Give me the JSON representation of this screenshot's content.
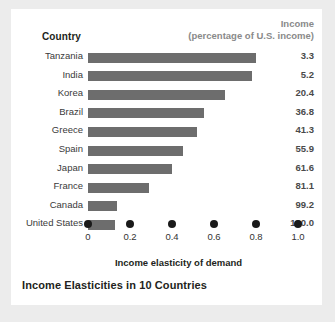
{
  "chart_data": {
    "type": "bar",
    "orientation": "horizontal",
    "title": "Income Elasticities in 10 Countries",
    "xlabel": "Income elasticity of demand",
    "ylabel": "",
    "xlim": [
      0,
      1.0
    ],
    "xticks": [
      "0",
      "0.2",
      "0.4",
      "0.6",
      "0.8",
      "1.0"
    ],
    "xtick_values": [
      0,
      0.2,
      0.4,
      0.6,
      0.8,
      1.0
    ],
    "grid": false,
    "legend": "none",
    "categories": [
      "Tanzania",
      "India",
      "Korea",
      "Brazil",
      "Greece",
      "Spain",
      "Japan",
      "France",
      "Canada",
      "United States"
    ],
    "values": [
      0.8,
      0.78,
      0.65,
      0.55,
      0.52,
      0.45,
      0.4,
      0.29,
      0.14,
      0.13
    ],
    "series": [
      {
        "name": "Income elasticity of demand",
        "values": [
          0.8,
          0.78,
          0.65,
          0.55,
          0.52,
          0.45,
          0.4,
          0.29,
          0.14,
          0.13
        ]
      },
      {
        "name": "Income (percentage of U.S. income)",
        "values": [
          3.3,
          5.2,
          20.4,
          36.8,
          41.3,
          55.9,
          61.6,
          81.1,
          99.2,
          100.0
        ]
      }
    ],
    "bar_color": "#6d6d6d"
  },
  "headers": {
    "country": "Country",
    "income_line1": "Income",
    "income_line2": "(percentage of U.S. income)"
  },
  "rows": [
    {
      "country": "Tanzania",
      "elasticity": 0.8,
      "income": "3.3"
    },
    {
      "country": "India",
      "elasticity": 0.78,
      "income": "5.2"
    },
    {
      "country": "Korea",
      "elasticity": 0.65,
      "income": "20.4"
    },
    {
      "country": "Brazil",
      "elasticity": 0.55,
      "income": "36.8"
    },
    {
      "country": "Greece",
      "elasticity": 0.52,
      "income": "41.3"
    },
    {
      "country": "Spain",
      "elasticity": 0.45,
      "income": "55.9"
    },
    {
      "country": "Japan",
      "elasticity": 0.4,
      "income": "61.6"
    },
    {
      "country": "France",
      "elasticity": 0.29,
      "income": "81.1"
    },
    {
      "country": "Canada",
      "elasticity": 0.14,
      "income": "99.2"
    },
    {
      "country": "United States",
      "elasticity": 0.13,
      "income": "100.0"
    }
  ],
  "axis": {
    "ticks": [
      "0",
      "0.2",
      "0.4",
      "0.6",
      "0.8",
      "1.0"
    ],
    "title": "Income elasticity of demand"
  },
  "caption": "Income Elasticities in 10 Countries",
  "colors": {
    "bar": "#6d6d6d",
    "page_background": "#ececec",
    "card_background": "#ffffff",
    "header_gray": "#8a8a8a",
    "text": "#231f20"
  }
}
